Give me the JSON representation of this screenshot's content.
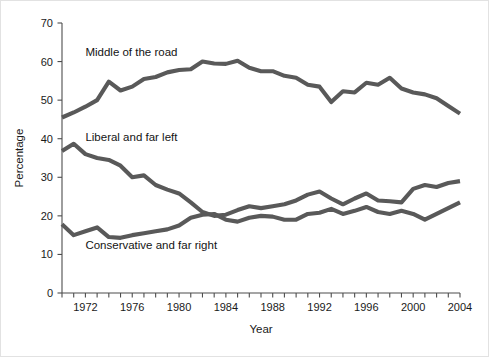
{
  "figure": {
    "background_color": "#ffffff",
    "border_color": "#e2e2e2",
    "width": 489,
    "height": 357
  },
  "chart_data": {
    "type": "line",
    "title": "",
    "xlabel": "Year",
    "ylabel": "Percentage",
    "xlim": [
      1970,
      2004
    ],
    "ylim": [
      0,
      70
    ],
    "yticks": [
      0,
      10,
      20,
      30,
      40,
      50,
      60,
      70
    ],
    "xticks_labeled": [
      1972,
      1976,
      1980,
      1984,
      1988,
      1992,
      1996,
      2000,
      2004
    ],
    "xtick_step_minor": 1,
    "grid": false,
    "legend": "inline-annotations",
    "line_color": "#595959",
    "x": [
      1970,
      1971,
      1972,
      1973,
      1974,
      1975,
      1976,
      1977,
      1978,
      1979,
      1980,
      1981,
      1982,
      1983,
      1984,
      1985,
      1986,
      1987,
      1988,
      1989,
      1990,
      1991,
      1992,
      1993,
      1994,
      1995,
      1996,
      1997,
      1998,
      1999,
      2000,
      2001,
      2002,
      2003,
      2004
    ],
    "series": [
      {
        "name": "Middle of the road",
        "label": "Middle of the road",
        "color": "#595959",
        "label_x": 1972.0,
        "label_y": 61.5,
        "values": [
          45.5,
          46.8,
          48.3,
          50.0,
          54.8,
          52.5,
          53.5,
          55.5,
          56.0,
          57.2,
          57.8,
          58.0,
          60.0,
          59.5,
          59.4,
          60.2,
          58.4,
          57.5,
          57.5,
          56.3,
          55.8,
          54.0,
          53.5,
          49.5,
          52.3,
          52.0,
          54.5,
          54.0,
          55.8,
          53.0,
          52.0,
          51.5,
          50.5,
          48.5,
          46.5
        ]
      },
      {
        "name": "Liberal and far left",
        "label": "Liberal and far left",
        "color": "#595959",
        "label_x": 1972.0,
        "label_y": 39.5,
        "values": [
          36.8,
          38.7,
          36.0,
          35.0,
          34.5,
          33.0,
          30.0,
          30.5,
          28.0,
          26.8,
          25.8,
          23.5,
          21.0,
          20.0,
          20.3,
          21.5,
          22.5,
          22.0,
          22.5,
          23.0,
          24.0,
          25.5,
          26.3,
          24.5,
          23.0,
          24.5,
          25.8,
          24.0,
          23.8,
          23.5,
          27.0,
          28.0,
          27.5,
          28.5,
          29.0
        ]
      },
      {
        "name": "Conservative and far right",
        "label": "Conservative and far right",
        "color": "#595959",
        "label_x": 1972.0,
        "label_y": 11.5,
        "values": [
          17.8,
          15.0,
          16.0,
          17.0,
          14.5,
          14.3,
          15.0,
          15.5,
          16.0,
          16.5,
          17.5,
          19.5,
          20.3,
          20.5,
          19.0,
          18.5,
          19.5,
          20.0,
          19.8,
          19.0,
          19.0,
          20.5,
          20.8,
          21.8,
          20.5,
          21.3,
          22.3,
          21.0,
          20.5,
          21.3,
          20.5,
          19.0,
          20.5,
          22.0,
          23.5
        ]
      }
    ]
  }
}
